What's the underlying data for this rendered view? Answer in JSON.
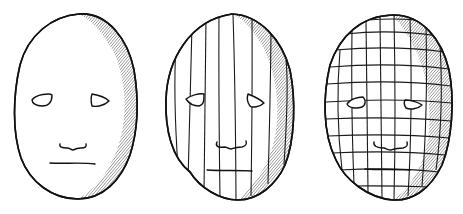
{
  "figure": {
    "background": "#ffffff",
    "ink": "#111111",
    "width": 463,
    "height": 214
  },
  "masks": [
    {
      "id": "plain",
      "description": "mask outline with shading, no grid",
      "outline": "M 79 14 C 108 12 128 40 134 70 C 139 100 138 130 130 155 C 121 180 103 199 78 199 C 52 199 30 182 21 158 C 12 132 13 95 20 65 C 28 35 52 16 79 14 Z",
      "shade": "M 79 14 C 108 12 128 40 134 70 C 139 100 138 130 130 155 C 121 180 103 199 78 199 C 95 190 112 170 120 140 C 128 110 125 80 115 55 C 105 35 92 20 79 14 Z",
      "eyes": [
        "M 32 100 C 36 94 50 93 52 95 C 52 101 50 106 42 106 C 36 106 32 103 32 100 Z",
        "M 92 94 C 98 95 106 98 109 101 C 104 106 96 107 92 106 C 91 102 91 97 92 94 Z"
      ],
      "nose": "M 60 144 C 59 147 62 148 67 148 C 70 148 71 150 73 150 C 75 149 77 148 81 148 C 85 148 87 147 86 144",
      "mouth": "M 50 163 C 65 164 80 162 95 164",
      "verticals": [],
      "horizontals": []
    },
    {
      "id": "vertical-lines",
      "description": "mask with vertical contour lines",
      "outline": "M 232 14 C 260 15 282 40 290 70 C 296 100 295 140 285 165 C 276 185 258 200 238 200 C 220 200 200 188 190 172 C 172 158 165 130 166 100 C 167 60 190 20 232 14 Z",
      "shade": "M 232 14 C 260 15 282 40 290 70 C 296 100 295 140 285 165 C 276 185 258 200 238 200 C 258 182 272 160 276 130 C 280 100 275 70 262 45 C 252 28 242 18 232 14 Z",
      "eyes": [
        "M 186 99 C 191 95 200 93 204 94 C 204 100 204 105 199 106 C 192 106 188 102 186 99 Z",
        "M 248 94 C 253 96 261 100 264 103 C 260 107 252 108 250 106 C 247 102 247 97 248 94 Z"
      ],
      "nose": "M 217 142 C 215 146 218 148 224 147 C 227 147 229 149 231 149 C 234 148 236 147 242 147 C 246 146 247 144 246 141",
      "mouth": "M 207 170 C 222 171 238 170 252 171",
      "verticals": [
        [
          [
            176,
            45
          ],
          [
            175,
            100
          ],
          [
            178,
            168
          ]
        ],
        [
          [
            192,
            25
          ],
          [
            190,
            100
          ],
          [
            188,
            182
          ]
        ],
        [
          [
            206,
            17
          ],
          [
            205,
            100
          ],
          [
            204,
            194
          ]
        ],
        [
          [
            219,
            14
          ],
          [
            219,
            100
          ],
          [
            220,
            199
          ]
        ],
        [
          [
            233,
            14
          ],
          [
            235,
            100
          ],
          [
            236,
            200
          ]
        ],
        [
          [
            252,
            18
          ],
          [
            252,
            100
          ],
          [
            251,
            196
          ]
        ],
        [
          [
            271,
            30
          ],
          [
            270,
            100
          ],
          [
            268,
            184
          ]
        ],
        [
          [
            286,
            60
          ],
          [
            287,
            100
          ],
          [
            284,
            165
          ]
        ]
      ],
      "horizontals": []
    },
    {
      "id": "grid",
      "description": "mask with full grid contour lines",
      "outline": "M 392 15 C 422 14 442 40 449 70 C 455 100 452 140 442 165 C 430 190 412 201 393 200 C 368 198 345 180 336 160 C 322 132 323 95 330 65 C 340 35 362 16 392 15 Z",
      "shade": "M 392 15 C 422 14 442 40 449 70 C 455 100 452 140 442 165 C 430 190 412 201 393 200 C 408 190 422 170 428 140 C 432 110 428 80 418 55 C 410 38 402 25 392 15 Z",
      "eyes": [
        "M 347 104 C 350 99 358 97 363 97 C 366 100 366 105 362 107 C 356 109 349 108 347 104 Z",
        "M 405 100 C 410 100 418 102 422 105 C 418 109 410 110 406 108 C 404 105 404 102 405 100 Z"
      ],
      "nose": "M 374 142 C 373 146 377 148 384 148 C 387 149 389 150 391 150 C 394 149 396 148 403 148 C 407 147 408 145 407 142",
      "mouth": "M 365 169 C 380 170 395 169 410 170",
      "verticals": [
        [
          [
            340,
            50
          ],
          [
            338,
            110
          ],
          [
            342,
            170
          ]
        ],
        [
          [
            352,
            28
          ],
          [
            352,
            110
          ],
          [
            354,
            184
          ]
        ],
        [
          [
            366,
            20
          ],
          [
            367,
            110
          ],
          [
            368,
            192
          ]
        ],
        [
          [
            380,
            16
          ],
          [
            381,
            110
          ],
          [
            382,
            197
          ]
        ],
        [
          [
            394,
            15
          ],
          [
            395,
            110
          ],
          [
            394,
            200
          ]
        ],
        [
          [
            410,
            18
          ],
          [
            411,
            110
          ],
          [
            408,
            196
          ]
        ],
        [
          [
            426,
            26
          ],
          [
            426,
            110
          ],
          [
            422,
            186
          ]
        ],
        [
          [
            440,
            45
          ],
          [
            441,
            110
          ],
          [
            436,
            170
          ]
        ]
      ],
      "horizontals": [
        [
          [
            368,
            20
          ],
          [
            392,
            19
          ],
          [
            416,
            20
          ]
        ],
        [
          [
            345,
            34
          ],
          [
            392,
            32
          ],
          [
            438,
            36
          ]
        ],
        [
          [
            335,
            50
          ],
          [
            392,
            48
          ],
          [
            445,
            52
          ]
        ],
        [
          [
            330,
            67
          ],
          [
            392,
            65
          ],
          [
            449,
            69
          ]
        ],
        [
          [
            327,
            84
          ],
          [
            392,
            82
          ],
          [
            451,
            86
          ]
        ],
        [
          [
            326,
            102
          ],
          [
            392,
            100
          ],
          [
            452,
            103
          ]
        ],
        [
          [
            326,
            119
          ],
          [
            392,
            118
          ],
          [
            451,
            121
          ]
        ],
        [
          [
            328,
            136
          ],
          [
            392,
            135
          ],
          [
            449,
            138
          ]
        ],
        [
          [
            332,
            153
          ],
          [
            392,
            152
          ],
          [
            445,
            155
          ]
        ],
        [
          [
            340,
            170
          ],
          [
            392,
            169
          ],
          [
            439,
            172
          ]
        ],
        [
          [
            352,
            186
          ],
          [
            392,
            186
          ],
          [
            430,
            187
          ]
        ]
      ]
    }
  ]
}
